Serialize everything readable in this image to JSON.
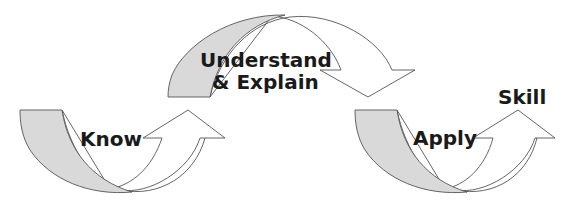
{
  "diagram": {
    "type": "curved-arrow-progression",
    "stages": [
      {
        "id": "know",
        "label": "Know"
      },
      {
        "id": "understand",
        "label_line1": "Understand",
        "label_line2": "& Explain"
      },
      {
        "id": "apply",
        "label": "Apply"
      },
      {
        "id": "skill",
        "label": "Skill"
      }
    ],
    "colors": {
      "shade": "#d9d9d9",
      "outline": "#555555",
      "arrow_fill": "#ffffff",
      "text": "#1a1a1a"
    }
  }
}
